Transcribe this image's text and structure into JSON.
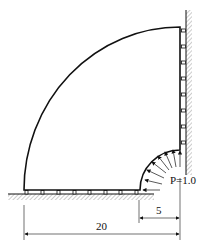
{
  "diagram": {
    "type": "quarter-annulus structural model",
    "load_label": "P=1.0",
    "dimensions": {
      "inner_radius_label": "5",
      "outer_radius_label": "20"
    },
    "supports": {
      "bottom": "roller supports on ground (8 rollers)",
      "right": "roller supports on fixed wall (7 rollers)"
    },
    "colors": {
      "line": "#111111",
      "hatch": "#999999",
      "background": "#ffffff"
    }
  }
}
